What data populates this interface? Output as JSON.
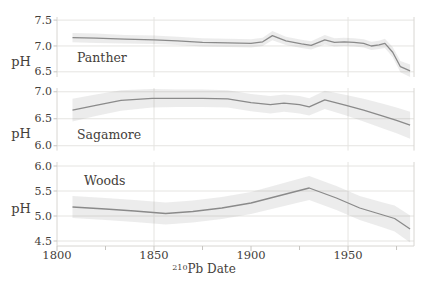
{
  "chart_data": {
    "type": "line",
    "title": "",
    "xlabel": "²¹⁰Pb Date",
    "xlabel_display": {
      "sup": "210",
      "main": "Pb Date"
    },
    "ylabel": "pH",
    "x_range": [
      1800,
      1984
    ],
    "x_ticks_major": [
      {
        "v": 1800,
        "label": "1800"
      },
      {
        "v": 1850,
        "label": "1850"
      },
      {
        "v": 1900,
        "label": "1900"
      },
      {
        "v": 1950,
        "label": "1950"
      }
    ],
    "x_ticks_minor": [
      1825,
      1875,
      1925,
      1975
    ],
    "x_gridlines": [
      1850,
      1950
    ],
    "grid": "on",
    "legend": "none",
    "panels": [
      {
        "label": "Panther",
        "ylabel": "pH",
        "ylim": [
          6.4,
          7.56
        ],
        "yticks": [
          {
            "v": 7.5,
            "label": "7.5"
          },
          {
            "v": 7.0,
            "label": "7.0"
          },
          {
            "v": 6.5,
            "label": "6.5"
          }
        ],
        "x": [
          1808,
          1820,
          1835,
          1850,
          1862,
          1875,
          1888,
          1900,
          1906,
          1911,
          1918,
          1926,
          1931,
          1938,
          1943,
          1948,
          1953,
          1958,
          1962,
          1966,
          1969,
          1973,
          1977,
          1982
        ],
        "ph": [
          7.16,
          7.15,
          7.13,
          7.12,
          7.1,
          7.07,
          7.06,
          7.05,
          7.08,
          7.2,
          7.1,
          7.04,
          7.01,
          7.12,
          7.07,
          7.08,
          7.07,
          7.05,
          7.0,
          7.02,
          7.05,
          6.88,
          6.6,
          6.52
        ],
        "band": [
          0.09,
          0.09,
          0.08,
          0.08,
          0.08,
          0.08,
          0.08,
          0.08,
          0.08,
          0.09,
          0.08,
          0.08,
          0.08,
          0.09,
          0.08,
          0.08,
          0.08,
          0.08,
          0.08,
          0.08,
          0.09,
          0.1,
          0.11,
          0.12
        ]
      },
      {
        "label": "Sagamore",
        "ylabel": "pH",
        "ylim": [
          5.91,
          7.07
        ],
        "yticks": [
          {
            "v": 7.0,
            "label": "7.0"
          },
          {
            "v": 6.5,
            "label": "6.5"
          },
          {
            "v": 6.0,
            "label": "6.0"
          }
        ],
        "x": [
          1808,
          1820,
          1833,
          1849,
          1862,
          1875,
          1888,
          1900,
          1910,
          1917,
          1925,
          1930,
          1938,
          1949,
          1958,
          1968,
          1975,
          1982
        ],
        "ph": [
          6.66,
          6.75,
          6.84,
          6.88,
          6.88,
          6.88,
          6.87,
          6.8,
          6.76,
          6.79,
          6.76,
          6.72,
          6.85,
          6.75,
          6.66,
          6.55,
          6.47,
          6.38
        ],
        "band": [
          0.21,
          0.2,
          0.19,
          0.17,
          0.16,
          0.16,
          0.16,
          0.16,
          0.16,
          0.16,
          0.16,
          0.16,
          0.17,
          0.19,
          0.21,
          0.23,
          0.24,
          0.25
        ]
      },
      {
        "label": "Woods",
        "ylabel": "pH",
        "ylim": [
          4.4,
          6.08
        ],
        "yticks": [
          {
            "v": 6.0,
            "label": "6.0"
          },
          {
            "v": 5.5,
            "label": "5.5"
          },
          {
            "v": 5.0,
            "label": "5.0"
          },
          {
            "v": 4.5,
            "label": "4.5"
          }
        ],
        "x": [
          1808,
          1825,
          1840,
          1856,
          1870,
          1885,
          1900,
          1915,
          1930,
          1944,
          1956,
          1968,
          1974,
          1982
        ],
        "ph": [
          5.18,
          5.14,
          5.1,
          5.05,
          5.09,
          5.16,
          5.26,
          5.41,
          5.56,
          5.36,
          5.16,
          5.02,
          4.95,
          4.74
        ],
        "band": [
          0.22,
          0.22,
          0.22,
          0.22,
          0.22,
          0.22,
          0.22,
          0.23,
          0.24,
          0.24,
          0.24,
          0.25,
          0.26,
          0.27
        ]
      }
    ],
    "colors": {
      "line": "#8a8a8a",
      "band": "rgba(148,148,148,0.18)",
      "grid": "#e5e4e1",
      "edge": "#d8d6d2",
      "tick": "#c7c5c1",
      "text": "#44403a"
    }
  }
}
